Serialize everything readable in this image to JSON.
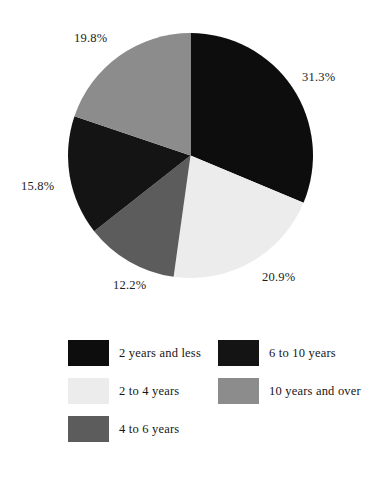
{
  "chart_data": {
    "type": "pie",
    "title": "",
    "subtitle": "",
    "xlabel": "",
    "ylabel": "",
    "grid": false,
    "legend_position": "bottom",
    "start_angle_deg": 0,
    "direction": "clockwise",
    "categories": [
      "2 years and less",
      "2 to 4 years",
      "4 to 6 years",
      "6 to 10 years",
      "10 years and over"
    ],
    "values": [
      31.3,
      20.9,
      12.2,
      15.8,
      19.8
    ],
    "value_unit": "%",
    "colors": [
      "#0d0d0d",
      "#ececec",
      "#5c5c5c",
      "#141414",
      "#8c8c8c"
    ],
    "slices": [
      {
        "label": "2 years and less",
        "value": 31.3,
        "display": "31.3%",
        "color": "#0d0d0d"
      },
      {
        "label": "2 to 4 years",
        "value": 20.9,
        "display": "20.9%",
        "color": "#ececec"
      },
      {
        "label": "4 to 6 years",
        "value": 12.2,
        "display": "12.2%",
        "color": "#5c5c5c"
      },
      {
        "label": "6 to 10 years",
        "value": 15.8,
        "display": "15.8%",
        "color": "#141414"
      },
      {
        "label": "10 years and over",
        "value": 19.8,
        "display": "19.8%",
        "color": "#8c8c8c"
      }
    ],
    "slice_labels": [
      "31.3%",
      "20.9%",
      "12.2%",
      "15.8%",
      "19.8%"
    ],
    "legend_entries": [
      {
        "label": "2 years and less",
        "color": "#0d0d0d"
      },
      {
        "label": "2 to 4 years",
        "color": "#ececec"
      },
      {
        "label": "4 to 6 years",
        "color": "#5c5c5c"
      },
      {
        "label": "6 to 10 years",
        "color": "#141414"
      },
      {
        "label": "10 years and over",
        "color": "#8c8c8c"
      }
    ]
  },
  "background_color": "#ffffff",
  "text_color": "#1a1a1a"
}
